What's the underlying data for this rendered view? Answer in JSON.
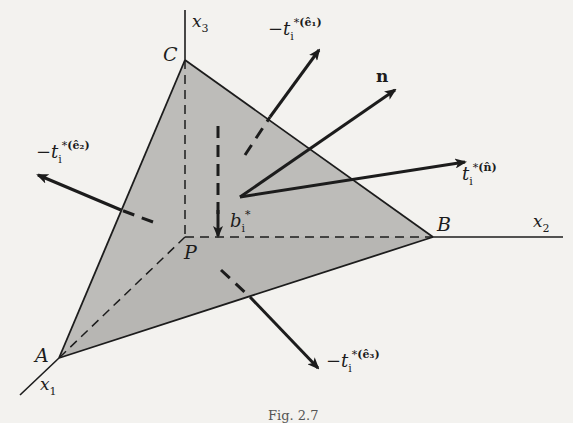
{
  "figure": {
    "caption": "Fig. 2.7",
    "colors": {
      "background": "#f3f2ef",
      "tetrahedron_fill": "#b9b8b5",
      "line": "#1c1c1c"
    },
    "axes": {
      "x1": {
        "symbol": "x",
        "subscript": "1"
      },
      "x2": {
        "symbol": "x",
        "subscript": "2"
      },
      "x3": {
        "symbol": "x",
        "subscript": "3"
      }
    },
    "points": {
      "A": "A",
      "B": "B",
      "C": "C",
      "P": "P"
    },
    "vectors": {
      "normal": {
        "label": "n"
      },
      "traction_n": {
        "prefix": "",
        "symbol": "t",
        "sub": "i",
        "sup_star": "*",
        "sup_hat": "(n̂)"
      },
      "traction_e1": {
        "prefix": "−",
        "symbol": "t",
        "sub": "i",
        "sup_star": "*",
        "sup_hat": "(ê₁)"
      },
      "traction_e2": {
        "prefix": "−",
        "symbol": "t",
        "sub": "i",
        "sup_star": "*",
        "sup_hat": "(ê₂)"
      },
      "traction_e3": {
        "prefix": "−",
        "symbol": "t",
        "sub": "i",
        "sup_star": "*",
        "sup_hat": "(ê₃)"
      },
      "body_force": {
        "symbol": "b",
        "sub": "i",
        "sup_star": "*"
      }
    }
  }
}
